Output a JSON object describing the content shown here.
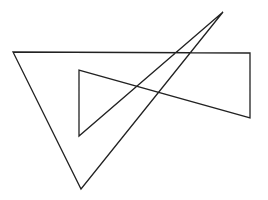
{
  "diagram": {
    "width": 268,
    "height": 200,
    "background": "#ffffff",
    "stroke": "#222222",
    "stroke_width": 1.3,
    "shape": "closed-polyline",
    "points": [
      [
        13,
        52
      ],
      [
        250,
        53
      ],
      [
        250,
        118
      ],
      [
        79,
        70
      ],
      [
        79,
        136
      ],
      [
        223,
        12
      ],
      [
        81,
        189
      ]
    ]
  }
}
